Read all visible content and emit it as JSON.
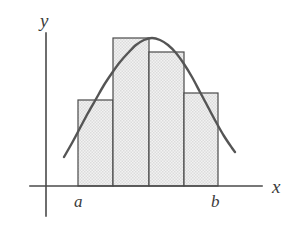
{
  "figure": {
    "background_color": "#ffffff",
    "width": 295,
    "height": 234
  },
  "axes": {
    "x_axis": {
      "label": "x",
      "color": "#4a4a4a",
      "start_x": 30,
      "end_x": 262,
      "y": 186,
      "label_x": 272,
      "label_y": 193
    },
    "y_axis": {
      "label": "y",
      "color": "#4a4a4a",
      "x": 46,
      "start_y": 33,
      "end_y": 216,
      "label_x": 40,
      "label_y": 27
    },
    "origin": {
      "x": 46,
      "y": 186
    }
  },
  "bounds": {
    "lower": {
      "label": "a",
      "x": 78,
      "label_x": 74,
      "label_y": 207
    },
    "upper": {
      "label": "b",
      "x": 218,
      "label_x": 211,
      "label_y": 207
    }
  },
  "style": {
    "curve_color": "#555555",
    "curve_width": 2.4,
    "rect_stroke_color": "#4a4a4a",
    "rect_stroke_width": 1.2,
    "rect_fill_color": "#efefef",
    "rect_hatch_color": "#c9c9c9",
    "axis_stroke_width": 1.6,
    "text_color": "#3b3b3b"
  },
  "chart_data": {
    "type": "area",
    "xlabel": "x",
    "ylabel": "y",
    "grid": false,
    "legend": "none",
    "baseline_y": 186,
    "interval": {
      "a": 78,
      "b": 218,
      "partitions": 4
    },
    "rectangles": [
      {
        "index": 1,
        "x_left": 78,
        "x_right": 113,
        "top_y": 100,
        "height": 86,
        "width": 35
      },
      {
        "index": 2,
        "x_left": 113,
        "x_right": 149,
        "top_y": 38,
        "height": 148,
        "width": 36
      },
      {
        "index": 3,
        "x_left": 149,
        "x_right": 184,
        "top_y": 52,
        "height": 134,
        "width": 35
      },
      {
        "index": 4,
        "x_left": 184,
        "x_right": 218,
        "top_y": 93,
        "height": 93,
        "width": 34
      }
    ],
    "curve": {
      "description": "smooth bell-shaped curve rising from lower left to a peak then falling to lower right",
      "peak": {
        "x": 150,
        "y": 38
      },
      "left_endpoint": {
        "x": 64,
        "y": 157
      },
      "right_endpoint": {
        "x": 235,
        "y": 152
      },
      "points": [
        [
          64,
          157
        ],
        [
          72,
          143
        ],
        [
          80,
          128
        ],
        [
          88,
          113
        ],
        [
          96,
          99
        ],
        [
          104,
          85
        ],
        [
          112,
          73
        ],
        [
          120,
          62
        ],
        [
          128,
          53
        ],
        [
          136,
          45
        ],
        [
          144,
          40
        ],
        [
          152,
          38
        ],
        [
          160,
          40
        ],
        [
          168,
          45
        ],
        [
          176,
          53
        ],
        [
          184,
          64
        ],
        [
          192,
          77
        ],
        [
          200,
          92
        ],
        [
          208,
          107
        ],
        [
          216,
          122
        ],
        [
          224,
          136
        ],
        [
          232,
          148
        ],
        [
          235,
          152
        ]
      ]
    }
  }
}
